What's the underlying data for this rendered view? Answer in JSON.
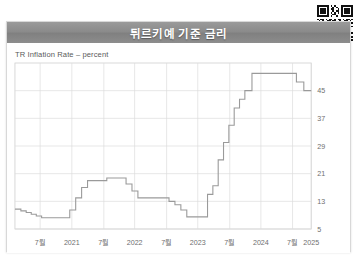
{
  "window": {
    "title": "튀르키예 기준 금리",
    "qr_name": "qr-code"
  },
  "chart_data": {
    "type": "line",
    "title": "튀르키예 기준 금리",
    "subtitle": "TR Inflation Rate – percent",
    "xlabel": "",
    "ylabel": "percent",
    "grid": true,
    "legend": false,
    "ylim": [
      5,
      53
    ],
    "yticks": [
      5,
      13,
      21,
      29,
      37,
      45
    ],
    "ytick_labels": [
      "5",
      "13",
      "21",
      "29",
      "37",
      "45"
    ],
    "xtick_labels": [
      "7월",
      "2021",
      "7월",
      "2022",
      "7월",
      "2023",
      "7월",
      "2024",
      "7월",
      "2025"
    ],
    "xtick_positions": [
      0.085,
      0.192,
      0.3,
      0.404,
      0.512,
      0.617,
      0.725,
      0.83,
      0.937,
      1.0
    ],
    "xlim_labels": [
      "2020-07",
      "2025-01"
    ],
    "line_color": "#9a9a9a",
    "series_name": "TR Policy Rate",
    "step_points": [
      {
        "x": 0.0,
        "y": 10.75
      },
      {
        "x": 0.02,
        "y": 10.25
      },
      {
        "x": 0.038,
        "y": 9.75
      },
      {
        "x": 0.055,
        "y": 9.25
      },
      {
        "x": 0.072,
        "y": 8.75
      },
      {
        "x": 0.09,
        "y": 8.25
      },
      {
        "x": 0.175,
        "y": 8.25
      },
      {
        "x": 0.185,
        "y": 10.5
      },
      {
        "x": 0.205,
        "y": 14.0
      },
      {
        "x": 0.225,
        "y": 17.0
      },
      {
        "x": 0.245,
        "y": 19.0
      },
      {
        "x": 0.29,
        "y": 19.0
      },
      {
        "x": 0.31,
        "y": 19.75
      },
      {
        "x": 0.355,
        "y": 19.75
      },
      {
        "x": 0.375,
        "y": 18.0
      },
      {
        "x": 0.395,
        "y": 16.0
      },
      {
        "x": 0.415,
        "y": 14.0
      },
      {
        "x": 0.455,
        "y": 14.0
      },
      {
        "x": 0.495,
        "y": 14.0
      },
      {
        "x": 0.52,
        "y": 13.0
      },
      {
        "x": 0.54,
        "y": 12.0
      },
      {
        "x": 0.56,
        "y": 10.5
      },
      {
        "x": 0.58,
        "y": 8.5
      },
      {
        "x": 0.635,
        "y": 8.5
      },
      {
        "x": 0.65,
        "y": 15.0
      },
      {
        "x": 0.668,
        "y": 17.5
      },
      {
        "x": 0.686,
        "y": 25.0
      },
      {
        "x": 0.704,
        "y": 30.0
      },
      {
        "x": 0.722,
        "y": 35.0
      },
      {
        "x": 0.74,
        "y": 40.0
      },
      {
        "x": 0.758,
        "y": 42.5
      },
      {
        "x": 0.776,
        "y": 45.0
      },
      {
        "x": 0.8,
        "y": 50.0
      },
      {
        "x": 0.93,
        "y": 50.0
      },
      {
        "x": 0.95,
        "y": 47.5
      },
      {
        "x": 0.975,
        "y": 45.0
      },
      {
        "x": 1.0,
        "y": 45.0
      }
    ]
  }
}
